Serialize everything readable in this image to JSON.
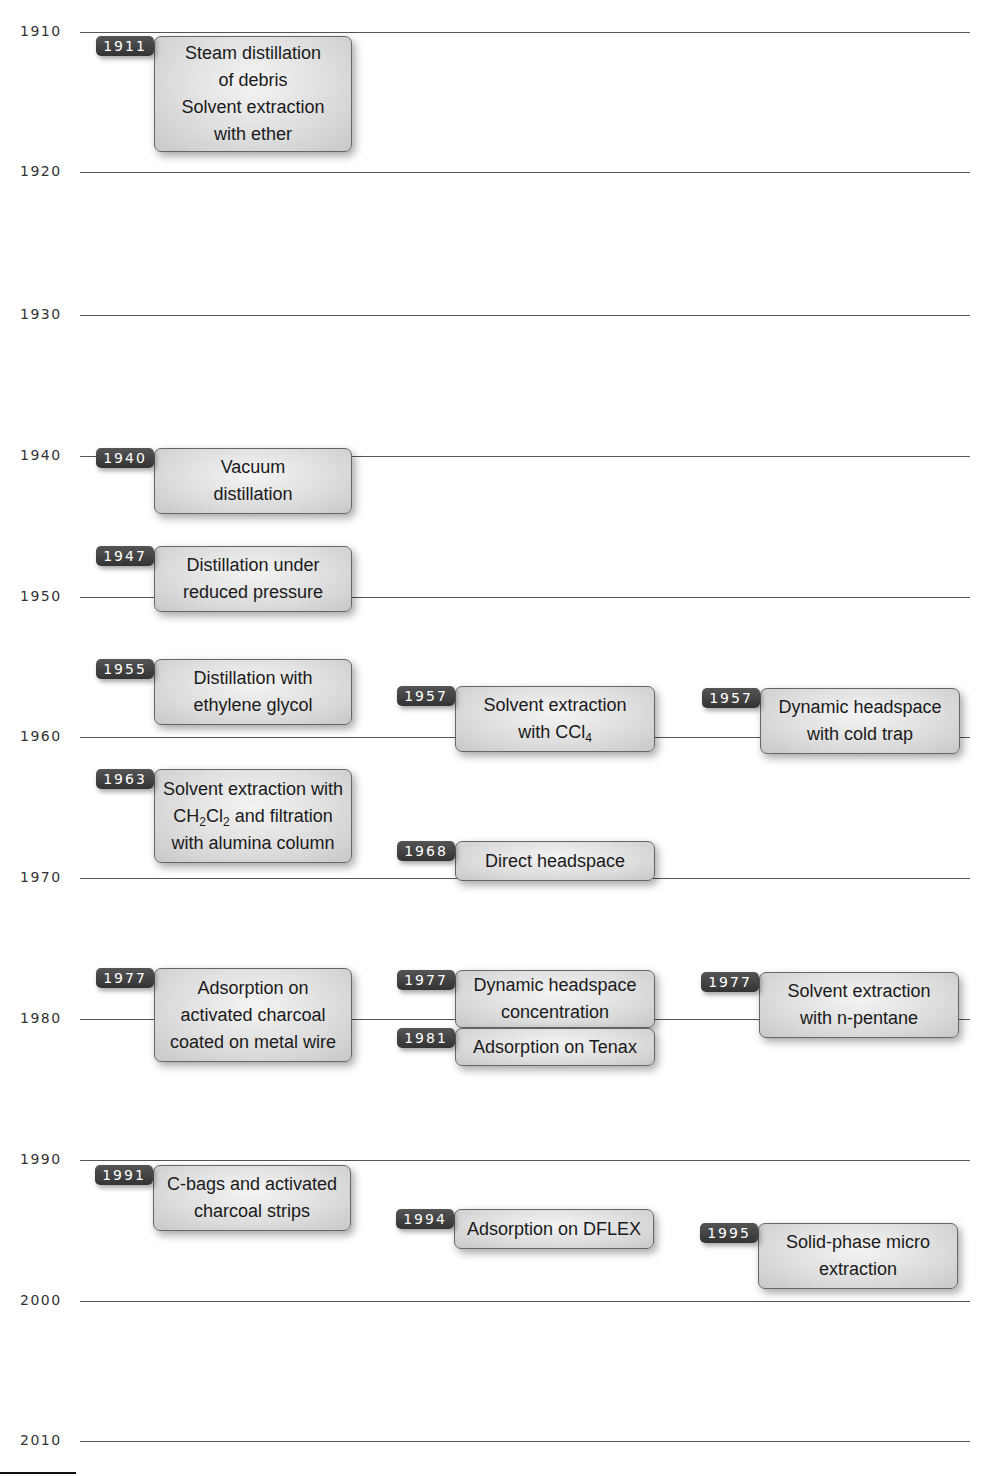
{
  "diagram": {
    "type": "timeline",
    "axis": {
      "ticks": [
        {
          "label": "1910",
          "y": 32
        },
        {
          "label": "1920",
          "y": 172
        },
        {
          "label": "1930",
          "y": 315
        },
        {
          "label": "1940",
          "y": 456
        },
        {
          "label": "1950",
          "y": 597
        },
        {
          "label": "1960",
          "y": 737
        },
        {
          "label": "1970",
          "y": 878
        },
        {
          "label": "1980",
          "y": 1019
        },
        {
          "label": "1990",
          "y": 1160
        },
        {
          "label": "2000",
          "y": 1301
        },
        {
          "label": "2010",
          "y": 1441
        }
      ]
    },
    "events": [
      {
        "year": "1911",
        "lines": [
          "Steam distillation",
          "of debris",
          "Solvent extraction",
          "with ether"
        ],
        "x": 96,
        "y": 36,
        "w": 198,
        "h": 116
      },
      {
        "year": "1940",
        "lines": [
          "Vacuum",
          "distillation"
        ],
        "x": 96,
        "y": 448,
        "w": 198,
        "h": 66
      },
      {
        "year": "1947",
        "lines": [
          "Distillation under",
          "reduced pressure"
        ],
        "x": 96,
        "y": 546,
        "w": 198,
        "h": 66
      },
      {
        "year": "1955",
        "lines": [
          "Distillation with",
          "ethylene glycol"
        ],
        "x": 96,
        "y": 659,
        "w": 198,
        "h": 66
      },
      {
        "year": "1957",
        "lines": [
          "Solvent extraction",
          "with CCl₄"
        ],
        "x": 397,
        "y": 686,
        "w": 200,
        "h": 66
      },
      {
        "year": "1957",
        "lines": [
          "Dynamic headspace",
          "with cold trap"
        ],
        "x": 702,
        "y": 688,
        "w": 200,
        "h": 66
      },
      {
        "year": "1963",
        "lines": [
          "Solvent extraction with",
          "CH₂Cl₂ and filtration",
          "with alumina column"
        ],
        "x": 96,
        "y": 769,
        "w": 198,
        "h": 94
      },
      {
        "year": "1968",
        "lines": [
          "Direct headspace"
        ],
        "x": 397,
        "y": 841,
        "w": 200,
        "h": 40
      },
      {
        "year": "1977",
        "lines": [
          "Adsorption on",
          "activated charcoal",
          "coated on metal wire"
        ],
        "x": 96,
        "y": 968,
        "w": 198,
        "h": 94
      },
      {
        "year": "1977",
        "lines": [
          "Dynamic headspace",
          "concentration"
        ],
        "x": 397,
        "y": 970,
        "w": 200,
        "h": 58
      },
      {
        "year": "1981",
        "lines": [
          "Adsorption on Tenax"
        ],
        "x": 397,
        "y": 1028,
        "w": 200,
        "h": 38
      },
      {
        "year": "1977",
        "lines": [
          "Solvent extraction",
          "with n-pentane"
        ],
        "x": 701,
        "y": 972,
        "w": 200,
        "h": 66
      },
      {
        "year": "1991",
        "lines": [
          "C-bags and activated",
          "charcoal strips"
        ],
        "x": 95,
        "y": 1165,
        "w": 198,
        "h": 66
      },
      {
        "year": "1994",
        "lines": [
          "Adsorption on DFLEX"
        ],
        "x": 396,
        "y": 1209,
        "w": 200,
        "h": 40
      },
      {
        "year": "1995",
        "lines": [
          "Solid-phase micro",
          "extraction"
        ],
        "x": 700,
        "y": 1223,
        "w": 200,
        "h": 66
      }
    ]
  }
}
